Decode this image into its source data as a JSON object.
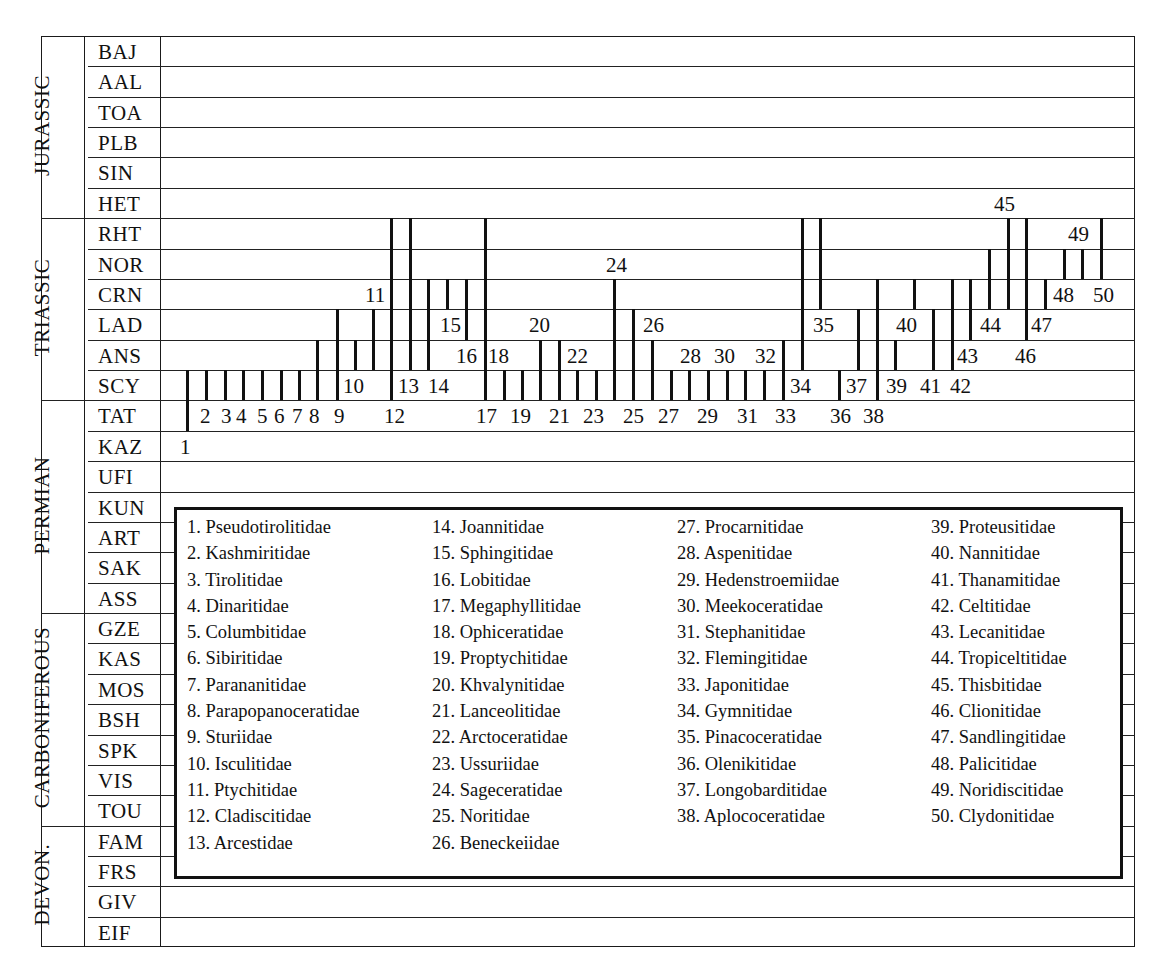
{
  "chart_data": {
    "type": "range-chart",
    "title": "",
    "xlabel": "",
    "ylabel": "",
    "periods": [
      {
        "name": "JURASSIC",
        "stages": [
          "BAJ",
          "AAL",
          "TOA",
          "PLB",
          "SIN",
          "HET"
        ]
      },
      {
        "name": "TRIASSIC",
        "stages": [
          "RHT",
          "NOR",
          "CRN",
          "LAD",
          "ANS",
          "SCY"
        ]
      },
      {
        "name": "PERMIAN",
        "stages": [
          "TAT",
          "KAZ",
          "UFI",
          "KUN",
          "ART",
          "SAK",
          "ASS"
        ]
      },
      {
        "name": "CARBONIFEROUS",
        "stages": [
          "GZE",
          "KAS",
          "MOS",
          "BSH",
          "SPK",
          "VIS",
          "TOU"
        ]
      },
      {
        "name": "DEVON.",
        "stages": [
          "FAM",
          "FRS",
          "GIV",
          "EIF"
        ]
      }
    ],
    "stages": [
      "BAJ",
      "AAL",
      "TOA",
      "PLB",
      "SIN",
      "HET",
      "RHT",
      "NOR",
      "CRN",
      "LAD",
      "ANS",
      "SCY",
      "TAT",
      "KAZ",
      "UFI",
      "KUN",
      "ART",
      "SAK",
      "ASS",
      "GZE",
      "KAS",
      "MOS",
      "BSH",
      "SPK",
      "VIS",
      "TOU",
      "FAM",
      "FRS",
      "GIV",
      "EIF"
    ],
    "ranges": [
      {
        "id": 1,
        "family": "Pseudotirolitidae",
        "first": "TAT",
        "last": "SCY"
      },
      {
        "id": 2,
        "family": "Kashmiritidae",
        "first": "SCY",
        "last": "SCY"
      },
      {
        "id": 3,
        "family": "Tirolitidae",
        "first": "SCY",
        "last": "SCY"
      },
      {
        "id": 4,
        "family": "Dinaritidae",
        "first": "SCY",
        "last": "SCY"
      },
      {
        "id": 5,
        "family": "Columbitidae",
        "first": "SCY",
        "last": "SCY"
      },
      {
        "id": 6,
        "family": "Sibiritidae",
        "first": "SCY",
        "last": "SCY"
      },
      {
        "id": 7,
        "family": "Parananitidae",
        "first": "SCY",
        "last": "SCY"
      },
      {
        "id": 8,
        "family": "Parapopanoceratidae",
        "first": "SCY",
        "last": "ANS"
      },
      {
        "id": 9,
        "family": "Sturiidae",
        "first": "SCY",
        "last": "LAD"
      },
      {
        "id": 10,
        "family": "Isculitidae",
        "first": "ANS",
        "last": "ANS"
      },
      {
        "id": 11,
        "family": "Ptychitidae",
        "first": "ANS",
        "last": "LAD"
      },
      {
        "id": 12,
        "family": "Cladiscitidae",
        "first": "SCY",
        "last": "RHT"
      },
      {
        "id": 13,
        "family": "Arcestidae",
        "first": "ANS",
        "last": "RHT"
      },
      {
        "id": 14,
        "family": "Joannitidae",
        "first": "ANS",
        "last": "CRN"
      },
      {
        "id": 15,
        "family": "Sphingitidae",
        "first": "CRN",
        "last": "CRN"
      },
      {
        "id": 16,
        "family": "Lobitidae",
        "first": "LAD",
        "last": "CRN"
      },
      {
        "id": 17,
        "family": "Megaphyllitidae",
        "first": "SCY",
        "last": "RHT"
      },
      {
        "id": 18,
        "family": "Ophiceratidae",
        "first": "SCY",
        "last": "SCY"
      },
      {
        "id": 19,
        "family": "Proptychitidae",
        "first": "SCY",
        "last": "SCY"
      },
      {
        "id": 20,
        "family": "Khvalynitidae",
        "first": "SCY",
        "last": "ANS"
      },
      {
        "id": 21,
        "family": "Lanceolitidae",
        "first": "SCY",
        "last": "ANS"
      },
      {
        "id": 22,
        "family": "Arctoceratidae",
        "first": "SCY",
        "last": "SCY"
      },
      {
        "id": 23,
        "family": "Ussuriidae",
        "first": "SCY",
        "last": "SCY"
      },
      {
        "id": 24,
        "family": "Sageceratidae",
        "first": "SCY",
        "last": "CRN"
      },
      {
        "id": 25,
        "family": "Noritidae",
        "first": "SCY",
        "last": "LAD"
      },
      {
        "id": 26,
        "family": "Beneckeiidae",
        "first": "SCY",
        "last": "ANS"
      },
      {
        "id": 27,
        "family": "Procarnitidae",
        "first": "SCY",
        "last": "SCY"
      },
      {
        "id": 28,
        "family": "Aspenitidae",
        "first": "SCY",
        "last": "SCY"
      },
      {
        "id": 29,
        "family": "Hedenstroemiidae",
        "first": "SCY",
        "last": "SCY"
      },
      {
        "id": 30,
        "family": "Meekoceratidae",
        "first": "SCY",
        "last": "SCY"
      },
      {
        "id": 31,
        "family": "Stephanitidae",
        "first": "SCY",
        "last": "SCY"
      },
      {
        "id": 32,
        "family": "Flemingitidae",
        "first": "SCY",
        "last": "SCY"
      },
      {
        "id": 33,
        "family": "Japonitidae",
        "first": "SCY",
        "last": "ANS"
      },
      {
        "id": 34,
        "family": "Gymnitidae",
        "first": "ANS",
        "last": "RHT"
      },
      {
        "id": 35,
        "family": "Pinacoceratidae",
        "first": "CRN",
        "last": "RHT"
      },
      {
        "id": 36,
        "family": "Olenikitidae",
        "first": "SCY",
        "last": "SCY"
      },
      {
        "id": 37,
        "family": "Longobarditidae",
        "first": "ANS",
        "last": "LAD"
      },
      {
        "id": 38,
        "family": "Aplococeratidae",
        "first": "SCY",
        "last": "CRN"
      },
      {
        "id": 39,
        "family": "Proteusitidae",
        "first": "ANS",
        "last": "ANS"
      },
      {
        "id": 40,
        "family": "Nannitidae",
        "first": "CRN",
        "last": "CRN"
      },
      {
        "id": 41,
        "family": "Thanamitidae",
        "first": "ANS",
        "last": "LAD"
      },
      {
        "id": 42,
        "family": "Celtitidae",
        "first": "ANS",
        "last": "CRN"
      },
      {
        "id": 43,
        "family": "Lecanitidae",
        "first": "LAD",
        "last": "CRN"
      },
      {
        "id": 44,
        "family": "Tropiceltitidae",
        "first": "CRN",
        "last": "NOR"
      },
      {
        "id": 45,
        "family": "Thisbitidae",
        "first": "CRN",
        "last": "RHT"
      },
      {
        "id": 46,
        "family": "Clionitidae",
        "first": "LAD",
        "last": "RHT"
      },
      {
        "id": 47,
        "family": "Sandlingitidae",
        "first": "CRN",
        "last": "CRN"
      },
      {
        "id": 48,
        "family": "Palicitidae",
        "first": "NOR",
        "last": "NOR"
      },
      {
        "id": 49,
        "family": "Noridiscitidae",
        "first": "NOR",
        "last": "NOR"
      },
      {
        "id": 50,
        "family": "Clydonitidae",
        "first": "NOR",
        "last": "RHT"
      }
    ],
    "legend_position": "inside-bottom"
  },
  "layout_bars": [
    {
      "id": "1",
      "x": 187,
      "top": 11,
      "bot": 12,
      "lx": 180,
      "lrow": 13
    },
    {
      "id": "2",
      "x": 206,
      "top": 11,
      "bot": 11,
      "lx": 200,
      "lrow": 12
    },
    {
      "id": "3",
      "x": 225,
      "top": 11,
      "bot": 11,
      "lx": 221,
      "lrow": 12
    },
    {
      "id": "4",
      "x": 243,
      "top": 11,
      "bot": 11,
      "lx": 236,
      "lrow": 12
    },
    {
      "id": "5",
      "x": 262,
      "top": 11,
      "bot": 11,
      "lx": 257,
      "lrow": 12
    },
    {
      "id": "6",
      "x": 281,
      "top": 11,
      "bot": 11,
      "lx": 274,
      "lrow": 12
    },
    {
      "id": "7",
      "x": 299,
      "top": 11,
      "bot": 11,
      "lx": 292,
      "lrow": 12
    },
    {
      "id": "8",
      "x": 317,
      "top": 10,
      "bot": 11,
      "lx": 309,
      "lrow": 12
    },
    {
      "id": "9",
      "x": 337,
      "top": 9,
      "bot": 11,
      "lx": 334,
      "lrow": 12
    },
    {
      "id": "10",
      "x": 355,
      "top": 10,
      "bot": 10,
      "lx": 343,
      "lrow": 11
    },
    {
      "id": "11",
      "x": 373,
      "top": 9,
      "bot": 10,
      "lx": 365,
      "lrow": 8
    },
    {
      "id": "12",
      "x": 391,
      "top": 6,
      "bot": 11,
      "lx": 384,
      "lrow": 12
    },
    {
      "id": "13",
      "x": 410,
      "top": 6,
      "bot": 10,
      "lx": 398,
      "lrow": 11
    },
    {
      "id": "14",
      "x": 428,
      "top": 8,
      "bot": 10,
      "lx": 428,
      "lrow": 11
    },
    {
      "id": "15",
      "x": 447,
      "top": 8,
      "bot": 8,
      "lx": 440,
      "lrow": 9
    },
    {
      "id": "16",
      "x": 466,
      "top": 8,
      "bot": 9,
      "lx": 456,
      "lrow": 10
    },
    {
      "id": "17",
      "x": 485,
      "top": 6,
      "bot": 11,
      "lx": 476,
      "lrow": 12
    },
    {
      "id": "18",
      "x": 504,
      "top": 11,
      "bot": 11,
      "lx": 488,
      "lrow": 10
    },
    {
      "id": "19",
      "x": 522,
      "top": 11,
      "bot": 11,
      "lx": 510,
      "lrow": 12
    },
    {
      "id": "20",
      "x": 540,
      "top": 10,
      "bot": 11,
      "lx": 529,
      "lrow": 9
    },
    {
      "id": "21",
      "x": 559,
      "top": 10,
      "bot": 11,
      "lx": 549,
      "lrow": 12
    },
    {
      "id": "22",
      "x": 577,
      "top": 11,
      "bot": 11,
      "lx": 567,
      "lrow": 10
    },
    {
      "id": "23",
      "x": 596,
      "top": 11,
      "bot": 11,
      "lx": 583,
      "lrow": 12
    },
    {
      "id": "24",
      "x": 614,
      "top": 8,
      "bot": 11,
      "lx": 606,
      "lrow": 7
    },
    {
      "id": "25",
      "x": 633,
      "top": 9,
      "bot": 11,
      "lx": 623,
      "lrow": 12
    },
    {
      "id": "26",
      "x": 652,
      "top": 10,
      "bot": 11,
      "lx": 643,
      "lrow": 9
    },
    {
      "id": "27",
      "x": 671,
      "top": 11,
      "bot": 11,
      "lx": 658,
      "lrow": 12
    },
    {
      "id": "28",
      "x": 689,
      "top": 11,
      "bot": 11,
      "lx": 680,
      "lrow": 10
    },
    {
      "id": "29",
      "x": 708,
      "top": 11,
      "bot": 11,
      "lx": 697,
      "lrow": 12
    },
    {
      "id": "30",
      "x": 727,
      "top": 11,
      "bot": 11,
      "lx": 714,
      "lrow": 10
    },
    {
      "id": "31",
      "x": 745,
      "top": 11,
      "bot": 11,
      "lx": 737,
      "lrow": 12
    },
    {
      "id": "32",
      "x": 764,
      "top": 11,
      "bot": 11,
      "lx": 755,
      "lrow": 10
    },
    {
      "id": "33",
      "x": 783,
      "top": 10,
      "bot": 11,
      "lx": 775,
      "lrow": 12
    },
    {
      "id": "34",
      "x": 802,
      "top": 6,
      "bot": 10,
      "lx": 790,
      "lrow": 11
    },
    {
      "id": "35",
      "x": 820,
      "top": 6,
      "bot": 8,
      "lx": 813,
      "lrow": 9
    },
    {
      "id": "36",
      "x": 839,
      "top": 11,
      "bot": 11,
      "lx": 830,
      "lrow": 12
    },
    {
      "id": "37",
      "x": 858,
      "top": 9,
      "bot": 10,
      "lx": 846,
      "lrow": 11
    },
    {
      "id": "38",
      "x": 877,
      "top": 8,
      "bot": 11,
      "lx": 863,
      "lrow": 12
    },
    {
      "id": "39",
      "x": 895,
      "top": 10,
      "bot": 10,
      "lx": 886,
      "lrow": 11
    },
    {
      "id": "40",
      "x": 914,
      "top": 8,
      "bot": 8,
      "lx": 896,
      "lrow": 9
    },
    {
      "id": "41",
      "x": 933,
      "top": 9,
      "bot": 10,
      "lx": 920,
      "lrow": 11
    },
    {
      "id": "42",
      "x": 952,
      "top": 8,
      "bot": 10,
      "lx": 950,
      "lrow": 11
    },
    {
      "id": "43",
      "x": 970,
      "top": 8,
      "bot": 9,
      "lx": 957,
      "lrow": 10
    },
    {
      "id": "44",
      "x": 989,
      "top": 7,
      "bot": 8,
      "lx": 980,
      "lrow": 9
    },
    {
      "id": "45",
      "x": 1008,
      "top": 6,
      "bot": 8,
      "lx": 994,
      "lrow": 5
    },
    {
      "id": "46",
      "x": 1026,
      "top": 6,
      "bot": 9,
      "lx": 1015,
      "lrow": 10
    },
    {
      "id": "47",
      "x": 1045,
      "top": 8,
      "bot": 8,
      "lx": 1031,
      "lrow": 9
    },
    {
      "id": "48",
      "x": 1064,
      "top": 7,
      "bot": 7,
      "lx": 1053,
      "lrow": 8
    },
    {
      "id": "49",
      "x": 1082,
      "top": 7,
      "bot": 7,
      "lx": 1068,
      "lrow": 6
    },
    {
      "id": "50",
      "x": 1101,
      "top": 6,
      "bot": 7,
      "lx": 1093,
      "lrow": 8
    }
  ],
  "legend": {
    "columns": [
      [
        "1. Pseudotirolitidae",
        "2. Kashmiritidae",
        "3. Tirolitidae",
        "4. Dinaritidae",
        "5. Columbitidae",
        "6. Sibiritidae",
        "7. Parananitidae",
        "8. Parapopanoceratidae",
        "9. Sturiidae",
        "10. Isculitidae",
        "11. Ptychitidae",
        "12. Cladiscitidae",
        "13. Arcestidae"
      ],
      [
        "14. Joannitidae",
        "15. Sphingitidae",
        "16. Lobitidae",
        "17. Megaphyllitidae",
        "18. Ophiceratidae",
        "19. Proptychitidae",
        "20. Khvalynitidae",
        "21. Lanceolitidae",
        "22. Arctoceratidae",
        "23. Ussuriidae",
        "24. Sageceratidae",
        "25. Noritidae",
        "26. Beneckeiidae"
      ],
      [
        "27. Procarnitidae",
        "28. Aspenitidae",
        "29. Hedenstroemiidae",
        "30. Meekoceratidae",
        "31. Stephanitidae",
        "32. Flemingitidae",
        "33. Japonitidae",
        "34. Gymnitidae",
        "35. Pinacoceratidae",
        "36. Olenikitidae",
        "37. Longobarditidae",
        "38. Aplococeratidae"
      ],
      [
        "39. Proteusitidae",
        "40. Nannitidae",
        "41. Thanamitidae",
        "42. Celtitidae",
        "43. Lecanitidae",
        "44. Tropiceltitidae",
        "45. Thisbitidae",
        "46. Clionitidae",
        "47. Sandlingitidae",
        "48. Palicitidae",
        "49. Noridiscitidae",
        "50. Clydonitidae"
      ]
    ]
  }
}
